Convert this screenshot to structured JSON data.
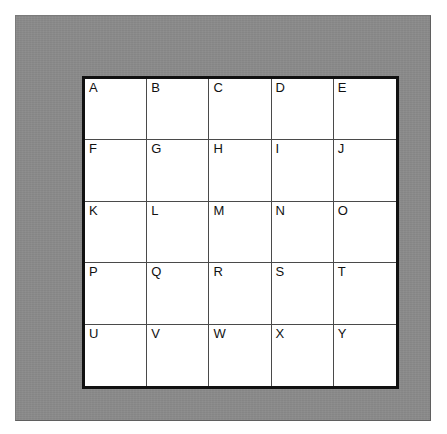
{
  "page": {
    "background_color": "#ffffff",
    "width": 447,
    "height": 434
  },
  "frame": {
    "name": "gray-mat-border",
    "color": "#8a8a8a",
    "outline_color": "#5f5f5f"
  },
  "grid": {
    "name": "letter-grid",
    "rows": 5,
    "columns": 5,
    "border_color": "#111111",
    "border_width_px": 3,
    "cell_line_color": "#4a4a4a",
    "cell_background": "#ffffff",
    "label_color": "#111111",
    "label_align": "top-left",
    "cells": [
      [
        {
          "label": "A"
        },
        {
          "label": "B"
        },
        {
          "label": "C"
        },
        {
          "label": "D"
        },
        {
          "label": "E"
        }
      ],
      [
        {
          "label": "F"
        },
        {
          "label": "G"
        },
        {
          "label": "H"
        },
        {
          "label": "I"
        },
        {
          "label": "J"
        }
      ],
      [
        {
          "label": "K"
        },
        {
          "label": "L"
        },
        {
          "label": "M"
        },
        {
          "label": "N"
        },
        {
          "label": "O"
        }
      ],
      [
        {
          "label": "P"
        },
        {
          "label": "Q"
        },
        {
          "label": "R"
        },
        {
          "label": "S"
        },
        {
          "label": "T"
        }
      ],
      [
        {
          "label": "U"
        },
        {
          "label": "V"
        },
        {
          "label": "W"
        },
        {
          "label": "X"
        },
        {
          "label": "Y"
        }
      ]
    ]
  }
}
